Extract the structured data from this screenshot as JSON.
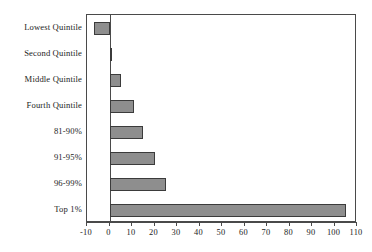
{
  "chart_data": {
    "type": "bar",
    "orientation": "horizontal",
    "title": "",
    "subtitle": "",
    "xlabel": "",
    "ylabel": "",
    "categories": [
      "Lowest Quintile",
      "Second Quintile",
      "Middle Quintile",
      "Fourth Quintile",
      "81-90%",
      "91-95%",
      "96-99%",
      "Top 1%"
    ],
    "values": [
      -7,
      1,
      5,
      11,
      15,
      20,
      25,
      105
    ],
    "xlim": [
      -10,
      110
    ],
    "ylim": null,
    "xticks": [
      -10,
      0,
      10,
      20,
      30,
      40,
      50,
      60,
      70,
      80,
      90,
      100,
      110
    ],
    "xtick_labels": [
      "-10",
      "0",
      "10",
      "20",
      "30",
      "40",
      "50",
      "60",
      "70",
      "80",
      "90",
      "100",
      "110"
    ],
    "grid": false,
    "legend": false,
    "legend_position": "none",
    "bar_fill_color": "#8e8e8e",
    "bar_edge_color": "#3b3b3b",
    "axis_color": "#4a4a4a",
    "background_color": "#ffffff",
    "zero_line": 0,
    "annotations": []
  }
}
